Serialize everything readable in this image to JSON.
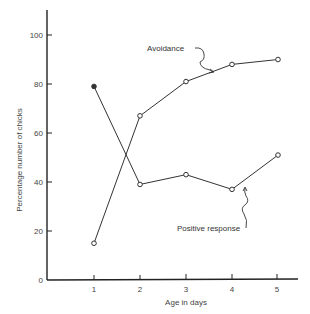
{
  "chart_data": {
    "type": "line",
    "title": "",
    "xlabel": "Age in days",
    "ylabel": "Percentage number of chicks",
    "x": [
      1,
      2,
      3,
      4,
      5
    ],
    "xticks": [
      "1",
      "2",
      "3",
      "4",
      "5"
    ],
    "yticks": [
      "0",
      "20",
      "40",
      "60",
      "80",
      "100"
    ],
    "ylim": [
      0,
      110
    ],
    "xlim": [
      0,
      5.6
    ],
    "grid": false,
    "legend": "none (inline annotations with arrows)",
    "series": [
      {
        "name": "Avoidance",
        "values": [
          15,
          67,
          81,
          88,
          90
        ]
      },
      {
        "name": "Positive response",
        "values": [
          79,
          39,
          43,
          37,
          51
        ]
      }
    ],
    "annotations": [
      {
        "text": "Avoidance",
        "points_to": "Avoidance series between day 3 and 4"
      },
      {
        "text": "Positive response",
        "points_to": "Positive response series between day 4 and 5"
      }
    ]
  },
  "labels": {
    "xlabel": "Age in days",
    "ylabel": "Percentage number of chicks",
    "avoidance": "Avoidance",
    "positive": "Positive response",
    "x1": "1",
    "x2": "2",
    "x3": "3",
    "x4": "4",
    "x5": "5",
    "y0": "0",
    "y20": "20",
    "y40": "40",
    "y60": "60",
    "y80": "80",
    "y100": "100"
  },
  "colors": {
    "line": "#333333",
    "axis": "#222222",
    "text": "#444444"
  }
}
